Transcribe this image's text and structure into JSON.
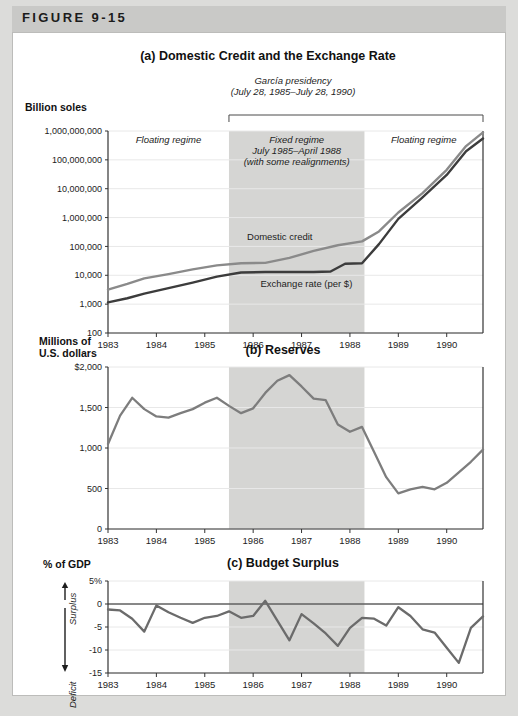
{
  "figure": {
    "label": "FIGURE 9-15"
  },
  "panels": {
    "a": {
      "title": "(a) Domestic Credit and the Exchange Rate",
      "y_axis_title": "Billion soles",
      "bracket_line1": "García presidency",
      "bracket_line2": "(July 28, 1985–July 28, 1990)",
      "regime_left": "Floating regime",
      "regime_mid_line1": "Fixed regime",
      "regime_mid_line2": "July 1985–April 1988",
      "regime_mid_line3": "(with some realignments)",
      "regime_right": "Floating regime",
      "label_credit": "Domestic credit",
      "label_exchange": "Exchange rate (per $)"
    },
    "b": {
      "title": "(b) Reserves",
      "y_axis_title_line1": "Millions of",
      "y_axis_title_line2": "U.S. dollars"
    },
    "c": {
      "title": "(c) Budget Surplus",
      "y_axis_title": "% of GDP",
      "surplus_label": "Surplus",
      "deficit_label": "Deficit"
    }
  },
  "colors": {
    "page_background": "#dcdcda",
    "header_band": "#c9c9c7",
    "card": "#ffffff",
    "shaded_regime": "#d5d5d3",
    "series_domestic_credit": "#8a8a8a",
    "series_exchange_rate": "#3c3c3c",
    "series_reserves": "#7d7d7d",
    "series_budget": "#6b6b6b",
    "axis": "#333333",
    "gridline": "#e8e8e8"
  },
  "chart_data": [
    {
      "type": "line",
      "panel": "a",
      "title": "(a) Domestic Credit and the Exchange Rate",
      "xlabel": "",
      "ylabel": "Billion soles",
      "yscale": "log",
      "ylim": [
        100,
        1000000000
      ],
      "ytick_labels": [
        "1,000,000,000",
        "100,000,000",
        "10,000,000",
        "1,000,000",
        "100,000",
        "10,000",
        "1,000",
        "100"
      ],
      "ytick_values": [
        1000000000,
        100000000,
        10000000,
        1000000,
        100000,
        10000,
        1000,
        100
      ],
      "xlim": [
        1983,
        1990.75
      ],
      "xtick_labels": [
        "1983",
        "1984",
        "1985",
        "1986",
        "1987",
        "1988",
        "1989",
        "1990"
      ],
      "xtick_values": [
        1983,
        1984,
        1985,
        1986,
        1987,
        1988,
        1989,
        1990
      ],
      "grid": true,
      "shaded_span": [
        1985.5,
        1988.3
      ],
      "series": [
        {
          "name": "Domestic credit",
          "x": [
            1983,
            1983.4,
            1983.75,
            1984.25,
            1984.75,
            1985.25,
            1985.75,
            1986.25,
            1986.75,
            1987.25,
            1987.75,
            1988.25,
            1988.6,
            1989.0,
            1989.5,
            1990.0,
            1990.4,
            1990.75
          ],
          "values": [
            3200,
            5000,
            7800,
            11000,
            16000,
            22000,
            26000,
            27000,
            40000,
            70000,
            110000,
            150000,
            330000,
            1500000,
            7000000,
            45000000,
            300000000,
            900000000
          ]
        },
        {
          "name": "Exchange rate (per $)",
          "x": [
            1983,
            1983.4,
            1983.75,
            1984.25,
            1984.75,
            1985.25,
            1985.75,
            1986.25,
            1986.75,
            1987.25,
            1987.6,
            1987.9,
            1988.25,
            1988.6,
            1989.0,
            1989.5,
            1990.0,
            1990.4,
            1990.75
          ],
          "values": [
            1150,
            1600,
            2300,
            3600,
            5600,
            9000,
            12500,
            13000,
            13000,
            13000,
            13500,
            25000,
            26000,
            120000,
            900000,
            5000000,
            30000000,
            200000000,
            550000000
          ]
        }
      ]
    },
    {
      "type": "line",
      "panel": "b",
      "title": "(b) Reserves",
      "xlabel": "",
      "ylabel": "Millions of U.S. dollars",
      "ylim": [
        0,
        2000
      ],
      "ytick_labels": [
        "$2,000",
        "1,500",
        "1,000",
        "500",
        "0"
      ],
      "ytick_values": [
        2000,
        1500,
        1000,
        500,
        0
      ],
      "xlim": [
        1983,
        1990.75
      ],
      "xtick_labels": [
        "1983",
        "1984",
        "1985",
        "1986",
        "1987",
        "1988",
        "1989",
        "1990"
      ],
      "xtick_values": [
        1983,
        1984,
        1985,
        1986,
        1987,
        1988,
        1989,
        1990
      ],
      "grid": true,
      "shaded_span": [
        1985.5,
        1988.3
      ],
      "series": [
        {
          "name": "Reserves",
          "x": [
            1983,
            1983.25,
            1983.5,
            1983.75,
            1984.0,
            1984.25,
            1984.5,
            1984.75,
            1985.0,
            1985.25,
            1985.5,
            1985.75,
            1986.0,
            1986.25,
            1986.5,
            1986.75,
            1987.0,
            1987.25,
            1987.5,
            1987.75,
            1988.0,
            1988.25,
            1988.5,
            1988.75,
            1989.0,
            1989.25,
            1989.5,
            1989.75,
            1990.0,
            1990.25,
            1990.5,
            1990.75
          ],
          "values": [
            1050,
            1400,
            1620,
            1480,
            1390,
            1375,
            1430,
            1480,
            1560,
            1620,
            1520,
            1430,
            1490,
            1680,
            1830,
            1900,
            1760,
            1610,
            1590,
            1290,
            1200,
            1260,
            950,
            640,
            440,
            490,
            520,
            490,
            570,
            700,
            830,
            980
          ]
        }
      ]
    },
    {
      "type": "line",
      "panel": "c",
      "title": "(c) Budget Surplus",
      "xlabel": "",
      "ylabel": "% of GDP",
      "ylim": [
        -15,
        5
      ],
      "ytick_labels": [
        "5%",
        "0",
        "-5",
        "-10",
        "-15"
      ],
      "ytick_values": [
        5,
        0,
        -5,
        -10,
        -15
      ],
      "xlim": [
        1983,
        1990.75
      ],
      "xtick_labels": [
        "1983",
        "1984",
        "1985",
        "1986",
        "1987",
        "1988",
        "1989",
        "1990"
      ],
      "xtick_values": [
        1983,
        1984,
        1985,
        1986,
        1987,
        1988,
        1989,
        1990
      ],
      "grid": true,
      "zero_line": 0,
      "shaded_span": [
        1985.5,
        1988.3
      ],
      "series": [
        {
          "name": "Budget surplus",
          "x": [
            1983,
            1983.25,
            1983.5,
            1983.75,
            1984.0,
            1984.25,
            1984.5,
            1984.75,
            1985.0,
            1985.25,
            1985.5,
            1985.75,
            1986.0,
            1986.25,
            1986.5,
            1986.75,
            1987.0,
            1987.25,
            1987.5,
            1987.75,
            1988.0,
            1988.25,
            1988.5,
            1988.75,
            1989.0,
            1989.25,
            1989.5,
            1989.75,
            1990.0,
            1990.25,
            1990.5,
            1990.75
          ],
          "values": [
            -1.2,
            -1.4,
            -3.2,
            -6.0,
            -0.3,
            -1.8,
            -3.0,
            -4.1,
            -3.0,
            -2.6,
            -1.6,
            -3.0,
            -2.6,
            0.7,
            -3.6,
            -7.9,
            -2.2,
            -4.2,
            -6.4,
            -9.1,
            -5.2,
            -3.0,
            -3.2,
            -4.7,
            -0.7,
            -2.6,
            -5.5,
            -6.2,
            -9.5,
            -12.8,
            -5.2,
            -2.7
          ]
        }
      ]
    }
  ]
}
